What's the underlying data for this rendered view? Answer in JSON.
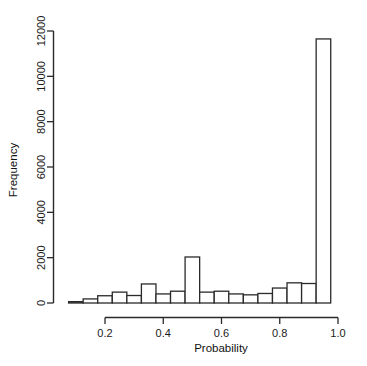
{
  "chart_data": {
    "type": "bar",
    "subtype": "histogram",
    "title": "",
    "subtitle": "",
    "xlabel": "Probability",
    "ylabel": "Frequency",
    "xlim": [
      0.05,
      1.0
    ],
    "ylim": [
      0,
      12000
    ],
    "grid": false,
    "legend": null,
    "legend_position": "none",
    "bar_fill_color": "#ffffff",
    "bar_edge_color": "#2a2a2a",
    "axis_color": "#2a2a2a",
    "bin_width": 0.05,
    "xticks": [
      0.2,
      0.4,
      0.6,
      0.8,
      1.0
    ],
    "xtick_labels": [
      "0.2",
      "0.4",
      "0.6",
      "0.8",
      "1.0"
    ],
    "yticks": [
      0,
      2000,
      4000,
      6000,
      8000,
      10000,
      12000
    ],
    "ytick_labels": [
      "0",
      "2000",
      "4000",
      "6000",
      "8000",
      "10000",
      "12000"
    ],
    "bin_edges": [
      0.075,
      0.125,
      0.175,
      0.225,
      0.275,
      0.325,
      0.375,
      0.425,
      0.475,
      0.525,
      0.575,
      0.625,
      0.675,
      0.725,
      0.775,
      0.825,
      0.875,
      0.925,
      0.975
    ],
    "categories": [
      "0.075-0.125",
      "0.125-0.175",
      "0.175-0.225",
      "0.225-0.275",
      "0.275-0.325",
      "0.325-0.375",
      "0.375-0.425",
      "0.425-0.475",
      "0.475-0.525",
      "0.525-0.575",
      "0.575-0.625",
      "0.625-0.675",
      "0.675-0.725",
      "0.725-0.775",
      "0.775-0.825",
      "0.825-0.875",
      "0.875-0.925",
      "0.925-0.975"
    ],
    "values": [
      60,
      180,
      320,
      480,
      330,
      840,
      400,
      520,
      2030,
      480,
      520,
      400,
      360,
      420,
      660,
      890,
      860,
      11650
    ],
    "max_value": 11650,
    "peak_bin": "0.925-0.975",
    "secondary_peak_bin": "0.475-0.525",
    "secondary_peak_value": 2030
  },
  "axes": {
    "x_title": "Probability",
    "y_title": "Frequency"
  }
}
